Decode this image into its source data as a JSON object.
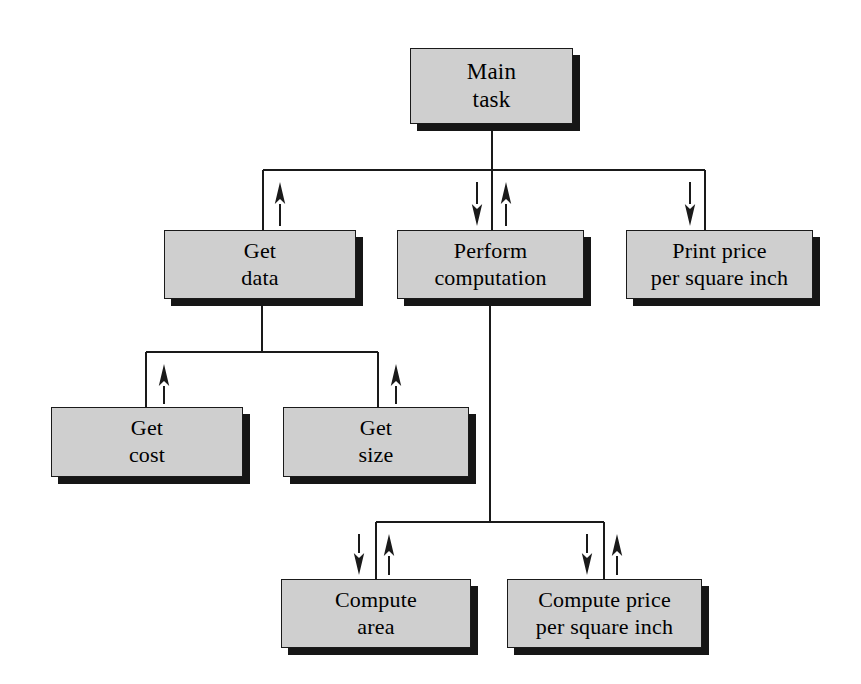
{
  "diagram": {
    "colors": {
      "box_fill": "#cfcfcf",
      "box_border": "#1a1a1a",
      "box_shadow": "#161616",
      "line": "#1a1a1a",
      "background": "#ffffff",
      "text": "#000000"
    },
    "nodes": [
      {
        "id": "main-task",
        "lines": [
          "Main",
          "task"
        ],
        "level": 0,
        "x": 410,
        "y": 48,
        "w": 163,
        "h": 76,
        "font_size": 23
      },
      {
        "id": "get-data",
        "lines": [
          "Get",
          "data"
        ],
        "level": 1,
        "x": 164,
        "y": 230,
        "w": 192,
        "h": 69,
        "font_size": 22
      },
      {
        "id": "perform-computation",
        "lines": [
          "Perform",
          "computation"
        ],
        "level": 1,
        "x": 397,
        "y": 230,
        "w": 187,
        "h": 69,
        "font_size": 22
      },
      {
        "id": "print-price-per-square-inch",
        "lines": [
          "Print price",
          "per square inch"
        ],
        "level": 1,
        "x": 626,
        "y": 230,
        "w": 187,
        "h": 69,
        "font_size": 22
      },
      {
        "id": "get-cost",
        "lines": [
          "Get",
          "cost"
        ],
        "level": 2,
        "x": 51,
        "y": 407,
        "w": 192,
        "h": 70,
        "font_size": 22
      },
      {
        "id": "get-size",
        "lines": [
          "Get",
          "size"
        ],
        "level": 2,
        "x": 283,
        "y": 407,
        "w": 186,
        "h": 70,
        "font_size": 22
      },
      {
        "id": "compute-area",
        "lines": [
          "Compute",
          "area"
        ],
        "level": 2,
        "x": 281,
        "y": 579,
        "w": 190,
        "h": 69,
        "font_size": 22
      },
      {
        "id": "compute-price-per-square-inch",
        "lines": [
          "Compute price",
          "per square inch"
        ],
        "level": 2,
        "x": 507,
        "y": 579,
        "w": 195,
        "h": 69,
        "font_size": 22
      }
    ],
    "connectors": {
      "main_trunk": {
        "x": 492,
        "y1": 124,
        "y2": 170
      },
      "level1_bus": {
        "y": 170,
        "x1": 263,
        "x2": 705
      },
      "drops_level1": [
        {
          "id": "drop-get-data",
          "x": 263,
          "y1": 170,
          "y2": 230
        },
        {
          "id": "drop-perform-computation",
          "x": 492,
          "y1": 170,
          "y2": 230
        },
        {
          "id": "drop-print-price",
          "x": 705,
          "y1": 170,
          "y2": 230
        }
      ],
      "get_data_trunk": {
        "x": 262,
        "y1": 299,
        "y2": 352
      },
      "get_data_bus": {
        "y": 352,
        "x1": 146,
        "x2": 378
      },
      "drops_get_data": [
        {
          "id": "drop-get-cost",
          "x": 146,
          "y1": 352,
          "y2": 407
        },
        {
          "id": "drop-get-size",
          "x": 378,
          "y1": 352,
          "y2": 407
        }
      ],
      "perform_trunk": {
        "x": 490,
        "y1": 299,
        "y2": 522
      },
      "perform_bus": {
        "y": 522,
        "x1": 376,
        "x2": 604
      },
      "drops_perform": [
        {
          "id": "drop-compute-area",
          "x": 376,
          "y1": 522,
          "y2": 579
        },
        {
          "id": "drop-compute-price",
          "x": 604,
          "y1": 522,
          "y2": 579
        }
      ]
    },
    "arrows": [
      {
        "id": "arrow-get-data-up",
        "direction": "up",
        "x": 280,
        "tip_y": 182,
        "tail_y": 226,
        "meaning": "returns data to Main task"
      },
      {
        "id": "arrow-perform-computation-down",
        "direction": "down",
        "x": 477,
        "tip_y": 226,
        "tail_y": 182,
        "meaning": "passes data to Perform computation"
      },
      {
        "id": "arrow-perform-computation-up",
        "direction": "up",
        "x": 506,
        "tip_y": 182,
        "tail_y": 226,
        "meaning": "returns price to Main task"
      },
      {
        "id": "arrow-print-price-down",
        "direction": "down",
        "x": 690,
        "tip_y": 226,
        "tail_y": 182,
        "meaning": "passes price to Print price"
      },
      {
        "id": "arrow-get-cost-up",
        "direction": "up",
        "x": 164,
        "tip_y": 364,
        "tail_y": 404,
        "meaning": "returns cost to Get data"
      },
      {
        "id": "arrow-get-size-up",
        "direction": "up",
        "x": 396,
        "tip_y": 364,
        "tail_y": 404,
        "meaning": "returns size to Get data"
      },
      {
        "id": "arrow-compute-area-down",
        "direction": "down",
        "x": 359,
        "tip_y": 575,
        "tail_y": 534,
        "meaning": "passes size to Compute area"
      },
      {
        "id": "arrow-compute-area-up",
        "direction": "up",
        "x": 389,
        "tip_y": 534,
        "tail_y": 575,
        "meaning": "returns area to Perform computation"
      },
      {
        "id": "arrow-compute-price-down",
        "direction": "down",
        "x": 587,
        "tip_y": 575,
        "tail_y": 534,
        "meaning": "passes cost and area to Compute price"
      },
      {
        "id": "arrow-compute-price-up",
        "direction": "up",
        "x": 617,
        "tip_y": 534,
        "tail_y": 575,
        "meaning": "returns price to Perform computation"
      }
    ]
  }
}
